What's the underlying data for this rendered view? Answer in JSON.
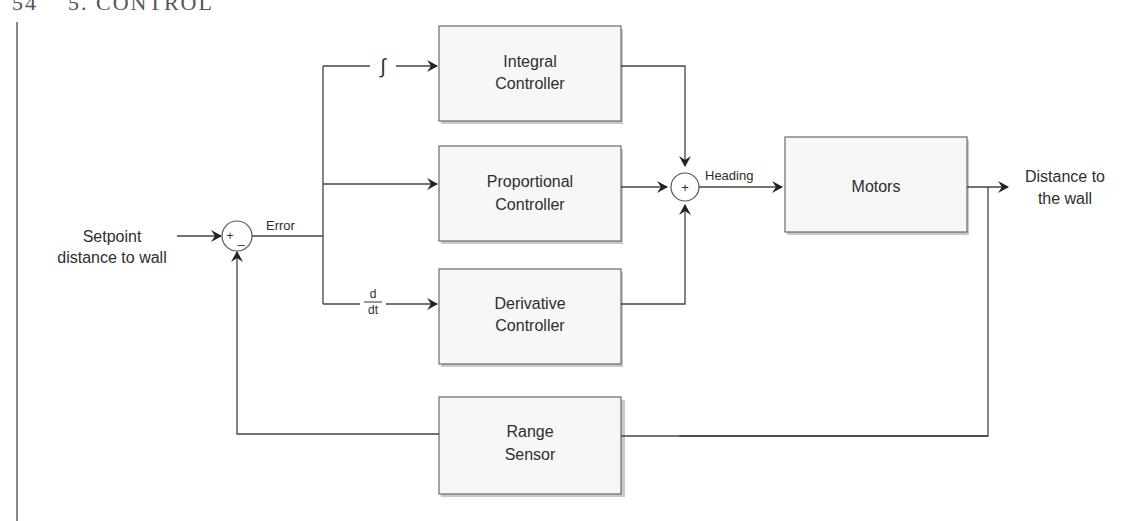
{
  "page_header": {
    "page_number": "54",
    "section": "5. CONTROL"
  },
  "diagram": {
    "type": "block-diagram",
    "input": {
      "label_line1": "Setpoint",
      "label_line2": "distance to wall"
    },
    "output": {
      "label_line1": "Distance to",
      "label_line2": "the wall"
    },
    "summing_junction_1": {
      "signs": "+_",
      "plus": "+",
      "minus": "_"
    },
    "summing_junction_2": {
      "sign": "+"
    },
    "signals": {
      "error": "Error",
      "heading": "Heading"
    },
    "operators": {
      "integral_symbol": "∫",
      "derivative_num": "d",
      "derivative_den": "dt"
    },
    "blocks": [
      {
        "id": "integral",
        "line1": "Integral",
        "line2": "Controller"
      },
      {
        "id": "proportional",
        "line1": "Proportional",
        "line2": "Controller"
      },
      {
        "id": "derivative",
        "line1": "Derivative",
        "line2": "Controller"
      },
      {
        "id": "motors",
        "line1": "Motors",
        "line2": ""
      },
      {
        "id": "range_sensor",
        "line1": "Range",
        "line2": "Sensor"
      }
    ]
  }
}
